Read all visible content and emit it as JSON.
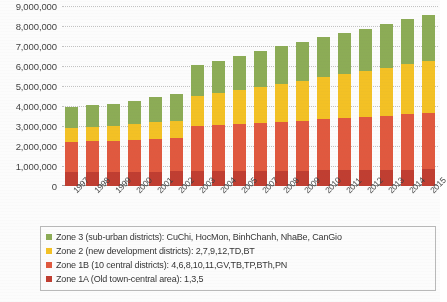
{
  "chart_data": {
    "type": "bar",
    "stacked": true,
    "title": "",
    "xlabel": "",
    "ylabel": "",
    "ylim": [
      0,
      9000000
    ],
    "ytick_step": 1000000,
    "ytick_labels": [
      "9,000,000",
      "8,000,000",
      "7,000,000",
      "6,000,000",
      "5,000,000",
      "4,000,000",
      "3,000,000",
      "2,000,000",
      "1,000,000",
      "0"
    ],
    "grid": true,
    "legend_position": "bottom",
    "categories": [
      "1997",
      "1998",
      "1999",
      "2000",
      "2001",
      "2002",
      "2003",
      "2004",
      "2005",
      "2007",
      "2008",
      "2009",
      "2010",
      "2011",
      "2012",
      "2013",
      "2014",
      "2015"
    ],
    "series": [
      {
        "name": "Zone 1A (Old town-central area): 1,3,5",
        "color": "#c0392b",
        "values": [
          700000,
          710000,
          715000,
          720000,
          725000,
          730000,
          740000,
          745000,
          750000,
          760000,
          765000,
          770000,
          780000,
          790000,
          800000,
          810000,
          820000,
          830000
        ]
      },
      {
        "name": "Zone 1B (10 central districts): 4,6,8,10,11,GV,TB,TP,BTh,PN",
        "color": "#e2553a",
        "values": [
          1500000,
          1530000,
          1560000,
          1600000,
          1640000,
          1680000,
          2260000,
          2300000,
          2350000,
          2400000,
          2450000,
          2500000,
          2560000,
          2600000,
          2650000,
          2700000,
          2760000,
          2820000
        ]
      },
      {
        "name": "Zone 2 (new development districts): 2,7,9,12,TD,BT",
        "color": "#f5c11e",
        "values": [
          700000,
          720000,
          740000,
          780000,
          820000,
          860000,
          1500000,
          1600000,
          1700000,
          1800000,
          1900000,
          2000000,
          2100000,
          2200000,
          2300000,
          2400000,
          2500000,
          2600000
        ]
      },
      {
        "name": "Zone 3 (sub-urban districts): CuChi, HocMon, BinhChanh, NhaBe, CanGio",
        "color": "#8aab52",
        "values": [
          1050000,
          1080000,
          1080000,
          1150000,
          1250000,
          1350000,
          1540000,
          1600000,
          1700000,
          1800000,
          1900000,
          1950000,
          2000000,
          2060000,
          2120000,
          2180000,
          2250000,
          2300000
        ]
      }
    ],
    "totals": [
      3950000,
      4040000,
      4095000,
      4250000,
      4435000,
      4620000,
      6040000,
      6245000,
      6500000,
      6760000,
      7015000,
      7220000,
      7440000,
      7650000,
      7870000,
      8090000,
      8330000,
      8550000
    ]
  },
  "legend": {
    "items": [
      {
        "label": "Zone 3 (sub-urban districts): CuChi, HocMon, BinhChanh, NhaBe, CanGio",
        "color": "#8aab52",
        "swatch_name": "legend-swatch-zone3"
      },
      {
        "label": "Zone 2 (new development districts): 2,7,9,12,TD,BT",
        "color": "#f5c11e",
        "swatch_name": "legend-swatch-zone2"
      },
      {
        "label": "Zone 1B (10 central districts): 4,6,8,10,11,GV,TB,TP,BTh,PN",
        "color": "#e2553a",
        "swatch_name": "legend-swatch-zone1b"
      },
      {
        "label": "Zone 1A (Old town-central area): 1,3,5",
        "color": "#c0392b",
        "swatch_name": "legend-swatch-zone1a"
      }
    ]
  }
}
